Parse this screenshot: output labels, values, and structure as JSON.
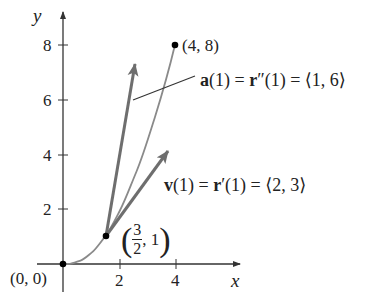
{
  "figure": {
    "axes": {
      "x_label": "x",
      "y_label": "y",
      "x_ticks": [
        {
          "value": 2,
          "label": "2"
        },
        {
          "value": 4,
          "label": "4"
        }
      ],
      "y_ticks": [
        {
          "value": 2,
          "label": "2"
        },
        {
          "value": 4,
          "label": "4"
        },
        {
          "value": 6,
          "label": "6"
        },
        {
          "value": 8,
          "label": "8"
        }
      ]
    },
    "points": {
      "origin": {
        "label": "(0, 0)"
      },
      "p1": {
        "label_num": "3",
        "label_den": "2",
        "label_rest": ", 1",
        "open": "(",
        "close": ")"
      },
      "end": {
        "label": "(4, 8)"
      }
    },
    "annotations": {
      "acceleration": {
        "bold": "a",
        "text": "(1) = ",
        "bold2": "r",
        "text2": "″(1) = ⟨1, 6⟩"
      },
      "velocity": {
        "bold": "v",
        "text": "(1) = ",
        "bold2": "r",
        "text2": "′(1) = ⟨2, 3⟩"
      }
    },
    "colors": {
      "axis": "#333333",
      "curve": "#8a8a8a",
      "vector": "#6e6e6e",
      "text": "#222222"
    }
  }
}
